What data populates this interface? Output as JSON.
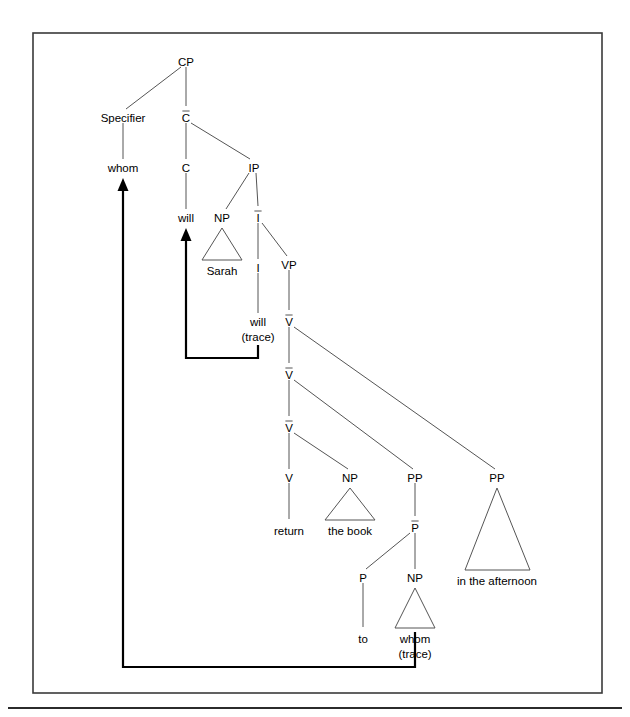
{
  "figure": {
    "kind": "x-bar-syntax-tree",
    "sentence": "whom will Sarah return the book to in the afternoon",
    "frame": {
      "x": 33,
      "y": 33,
      "width": 569,
      "height": 660
    },
    "bottom_rule": {
      "y": 708,
      "x1": 8,
      "x2": 622
    },
    "colors": {
      "line": "#555555",
      "text": "#000000",
      "arrow": "#000000",
      "frame": "#3a3a3a",
      "background": "#ffffff"
    }
  },
  "nodes": [
    {
      "id": "CP",
      "label": "CP",
      "x": 186,
      "y": 62,
      "bar": false
    },
    {
      "id": "Specifier",
      "label": "Specifier",
      "x": 123,
      "y": 118,
      "bar": false
    },
    {
      "id": "Cbar",
      "label": "C",
      "x": 186,
      "y": 118,
      "bar": true
    },
    {
      "id": "whom_spec",
      "label": "whom",
      "x": 123,
      "y": 168,
      "bar": false
    },
    {
      "id": "C",
      "label": "C",
      "x": 186,
      "y": 168,
      "bar": false
    },
    {
      "id": "IP",
      "label": "IP",
      "x": 254,
      "y": 168,
      "bar": false
    },
    {
      "id": "will_C",
      "label": "will",
      "x": 186,
      "y": 218,
      "bar": false
    },
    {
      "id": "NP_subj",
      "label": "NP",
      "x": 222,
      "y": 218,
      "bar": false
    },
    {
      "id": "Ibar",
      "label": "I",
      "x": 258,
      "y": 218,
      "bar": true
    },
    {
      "id": "Sarah",
      "label": "Sarah",
      "x": 222,
      "y": 271,
      "bar": false
    },
    {
      "id": "I",
      "label": "I",
      "x": 258,
      "y": 268,
      "bar": false
    },
    {
      "id": "VP",
      "label": "VP",
      "x": 289,
      "y": 265,
      "bar": false
    },
    {
      "id": "will_tr",
      "label": "will",
      "x": 258,
      "y": 322,
      "bar": false
    },
    {
      "id": "will_tr2",
      "label": "(trace)",
      "x": 258,
      "y": 337,
      "bar": false
    },
    {
      "id": "Vbar1",
      "label": "V",
      "x": 289,
      "y": 322,
      "bar": true
    },
    {
      "id": "Vbar2",
      "label": "V",
      "x": 289,
      "y": 375,
      "bar": true
    },
    {
      "id": "Vbar3",
      "label": "V",
      "x": 289,
      "y": 428,
      "bar": true
    },
    {
      "id": "V",
      "label": "V",
      "x": 289,
      "y": 478,
      "bar": false
    },
    {
      "id": "NP_obj",
      "label": "NP",
      "x": 350,
      "y": 478,
      "bar": false
    },
    {
      "id": "PP_to",
      "label": "PP",
      "x": 415,
      "y": 478,
      "bar": false
    },
    {
      "id": "PP_aft",
      "label": "PP",
      "x": 497,
      "y": 478,
      "bar": false
    },
    {
      "id": "return",
      "label": "return",
      "x": 289,
      "y": 531,
      "bar": false
    },
    {
      "id": "the_book",
      "label": "the book",
      "x": 350,
      "y": 531,
      "bar": false
    },
    {
      "id": "Pbar",
      "label": "P",
      "x": 415,
      "y": 528,
      "bar": true
    },
    {
      "id": "aft_text",
      "label": "in the afternoon",
      "x": 497,
      "y": 581,
      "bar": false
    },
    {
      "id": "P",
      "label": "P",
      "x": 363,
      "y": 578,
      "bar": false
    },
    {
      "id": "NP_trace",
      "label": "NP",
      "x": 415,
      "y": 578,
      "bar": false
    },
    {
      "id": "to",
      "label": "to",
      "x": 363,
      "y": 639,
      "bar": false
    },
    {
      "id": "whom_tr",
      "label": "whom",
      "x": 415,
      "y": 639,
      "bar": false
    },
    {
      "id": "whom_tr2",
      "label": "(trace)",
      "x": 415,
      "y": 654,
      "bar": false
    }
  ],
  "edges": [
    {
      "from": "CP",
      "to": "Specifier",
      "x1": 181,
      "y1": 67,
      "x2": 126,
      "y2": 109
    },
    {
      "from": "CP",
      "to": "Cbar",
      "x1": 186,
      "y1": 67,
      "x2": 186,
      "y2": 106
    },
    {
      "from": "Specifier",
      "to": "whom_spec",
      "x1": 123,
      "y1": 123,
      "x2": 123,
      "y2": 159
    },
    {
      "from": "Cbar",
      "to": "C",
      "x1": 186,
      "y1": 123,
      "x2": 186,
      "y2": 159
    },
    {
      "from": "Cbar",
      "to": "IP",
      "x1": 191,
      "y1": 123,
      "x2": 250,
      "y2": 159
    },
    {
      "from": "C",
      "to": "will_C",
      "x1": 186,
      "y1": 173,
      "x2": 186,
      "y2": 209
    },
    {
      "from": "IP",
      "to": "NP_subj",
      "x1": 249,
      "y1": 173,
      "x2": 226,
      "y2": 209
    },
    {
      "from": "IP",
      "to": "Ibar",
      "x1": 256,
      "y1": 173,
      "x2": 258,
      "y2": 206
    },
    {
      "from": "Ibar",
      "to": "I",
      "x1": 258,
      "y1": 223,
      "x2": 258,
      "y2": 259
    },
    {
      "from": "Ibar",
      "to": "VP",
      "x1": 262,
      "y1": 223,
      "x2": 287,
      "y2": 256
    },
    {
      "from": "I",
      "to": "will_tr",
      "x1": 258,
      "y1": 273,
      "x2": 258,
      "y2": 313
    },
    {
      "from": "VP",
      "to": "Vbar1",
      "x1": 289,
      "y1": 270,
      "x2": 289,
      "y2": 310
    },
    {
      "from": "Vbar1",
      "to": "Vbar2",
      "x1": 289,
      "y1": 327,
      "x2": 289,
      "y2": 363
    },
    {
      "from": "Vbar1",
      "to": "PP_aft",
      "x1": 294,
      "y1": 327,
      "x2": 495,
      "y2": 469
    },
    {
      "from": "Vbar2",
      "to": "Vbar3",
      "x1": 289,
      "y1": 380,
      "x2": 289,
      "y2": 416
    },
    {
      "from": "Vbar2",
      "to": "PP_to",
      "x1": 294,
      "y1": 380,
      "x2": 413,
      "y2": 469
    },
    {
      "from": "Vbar3",
      "to": "V",
      "x1": 289,
      "y1": 433,
      "x2": 289,
      "y2": 469
    },
    {
      "from": "Vbar3",
      "to": "NP_obj",
      "x1": 294,
      "y1": 433,
      "x2": 348,
      "y2": 469
    },
    {
      "from": "V",
      "to": "return",
      "x1": 289,
      "y1": 483,
      "x2": 289,
      "y2": 519
    },
    {
      "from": "PP_to",
      "to": "Pbar",
      "x1": 415,
      "y1": 483,
      "x2": 415,
      "y2": 516
    },
    {
      "from": "Pbar",
      "to": "P",
      "x1": 410,
      "y1": 533,
      "x2": 366,
      "y2": 569
    },
    {
      "from": "Pbar",
      "to": "NP_trace",
      "x1": 415,
      "y1": 533,
      "x2": 415,
      "y2": 569
    },
    {
      "from": "P",
      "to": "to",
      "x1": 363,
      "y1": 583,
      "x2": 363,
      "y2": 627
    }
  ],
  "triangles": [
    {
      "id": "tri_sarah",
      "apex_x": 222,
      "apex_y": 228,
      "left_x": 202,
      "right_x": 242,
      "base_y": 260
    },
    {
      "id": "tri_thebook",
      "apex_x": 350,
      "apex_y": 488,
      "left_x": 325,
      "right_x": 375,
      "base_y": 520
    },
    {
      "id": "tri_after",
      "apex_x": 497,
      "apex_y": 488,
      "left_x": 465,
      "right_x": 530,
      "base_y": 570
    },
    {
      "id": "tri_whomtr",
      "apex_x": 415,
      "apex_y": 588,
      "left_x": 395,
      "right_x": 435,
      "base_y": 628
    }
  ],
  "movements": [
    {
      "id": "wh-movement",
      "description": "whom (trace) raises to Specifier of CP",
      "path": "M 415 632 L 415 667 L 123 667 L 123 188",
      "arrow_tip_x": 123,
      "arrow_tip_y": 178
    },
    {
      "id": "head-movement",
      "description": "will (trace) raises to C",
      "path": "M 258 345 L 258 358 L 186 358 L 186 238",
      "arrow_tip_x": 186,
      "arrow_tip_y": 228
    }
  ]
}
